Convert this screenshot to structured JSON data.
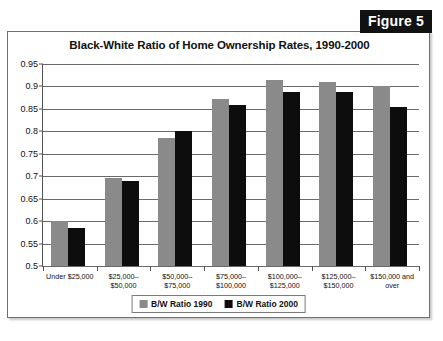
{
  "figure": {
    "badge_label": "Figure 5"
  },
  "chart_data": {
    "type": "bar",
    "title": "Black-White Ratio of Home Ownership Rates, 1990-2000",
    "xlabel": "",
    "ylabel": "",
    "ylim": [
      0.5,
      0.95
    ],
    "ytick_step": 0.05,
    "ytick_labels": [
      "0.95",
      "0.9",
      "0.85",
      "0.8",
      "0.75",
      "0.7",
      "0.65",
      "0.6",
      "0.55",
      "0.5"
    ],
    "grid": true,
    "legend_position": "bottom-center",
    "categories": [
      "Under $25,000",
      "$25,000–$50,000",
      "$50,000–$75,000",
      "$75,000–\n$100,000",
      "$100,000–\n$125,000",
      "$125,000–\n$150,000",
      "$150,000 and over"
    ],
    "series": [
      {
        "name": "B/W Ratio 1990",
        "color": "#8a8a8a",
        "values": [
          0.6,
          0.697,
          0.785,
          0.873,
          0.915,
          0.91,
          0.9
        ]
      },
      {
        "name": "B/W Ratio 2000",
        "color": "#0d0d0d",
        "values": [
          0.585,
          0.69,
          0.8,
          0.858,
          0.888,
          0.888,
          0.855
        ]
      }
    ]
  }
}
